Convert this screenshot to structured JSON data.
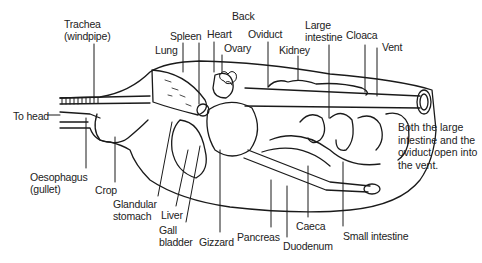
{
  "diagram": {
    "labels": [
      {
        "id": "trachea",
        "text": "Trachea\n(windpipe)",
        "x": 64,
        "y": 20
      },
      {
        "id": "back",
        "text": "Back",
        "x": 232,
        "y": 11
      },
      {
        "id": "spleen",
        "text": "Spleen",
        "x": 170,
        "y": 31
      },
      {
        "id": "heart",
        "text": "Heart",
        "x": 206,
        "y": 29
      },
      {
        "id": "oviduct",
        "text": "Oviduct",
        "x": 247,
        "y": 28
      },
      {
        "id": "large-intestine",
        "text": "Large\nintestine",
        "x": 305,
        "y": 19
      },
      {
        "id": "cloaca",
        "text": "Cloaca",
        "x": 346,
        "y": 29
      },
      {
        "id": "vent",
        "text": "Vent",
        "x": 382,
        "y": 41
      },
      {
        "id": "lung",
        "text": "Lung",
        "x": 155,
        "y": 44
      },
      {
        "id": "ovary",
        "text": "Ovary",
        "x": 225,
        "y": 43
      },
      {
        "id": "kidney",
        "text": "Kidney",
        "x": 279,
        "y": 44
      },
      {
        "id": "to-head",
        "text": "To head",
        "x": 13,
        "y": 111
      },
      {
        "id": "oesophagus",
        "text": "Oesophagus\n(gullet)",
        "x": 30,
        "y": 171
      },
      {
        "id": "crop",
        "text": "Crop",
        "x": 95,
        "y": 185
      },
      {
        "id": "glandular-stomach",
        "text": "Glandular\nstomach",
        "x": 113,
        "y": 198
      },
      {
        "id": "liver",
        "text": "Liver",
        "x": 161,
        "y": 209
      },
      {
        "id": "gall-bladder",
        "text": "Gall\nbladder",
        "x": 159,
        "y": 225
      },
      {
        "id": "gizzard",
        "text": "Gizzard",
        "x": 199,
        "y": 236
      },
      {
        "id": "pancreas",
        "text": "Pancreas",
        "x": 237,
        "y": 231
      },
      {
        "id": "caeca",
        "text": "Caeca",
        "x": 296,
        "y": 220
      },
      {
        "id": "duodenum",
        "text": "Duodenum",
        "x": 283,
        "y": 240
      },
      {
        "id": "small-intestine",
        "text": "Small intestine",
        "x": 343,
        "y": 230
      }
    ],
    "note": "Both the large intestine and the oviduct open into the vent."
  },
  "colors": {
    "ink": "#1a1a1a",
    "background": "#ffffff"
  }
}
